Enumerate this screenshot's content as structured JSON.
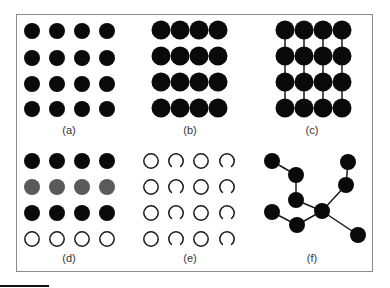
{
  "figure": {
    "colors": {
      "filled": "#0a0a0a",
      "gray": "#5a5a5a",
      "outline": "#1a1a1a",
      "edge": "#1a1a1a",
      "frame": "#8a8a8a"
    },
    "panels": [
      {
        "id": "a",
        "label": "(a)",
        "label_pos": [
          69,
          124
        ],
        "description": "4x4 grid of separated filled circles",
        "cols": [
          32,
          57,
          82,
          107
        ],
        "rows": [
          31,
          58,
          84,
          109
        ],
        "radius": 8,
        "row_styles": [
          "filled",
          "filled",
          "filled",
          "filled"
        ]
      },
      {
        "id": "b",
        "label": "(b)",
        "label_pos": [
          190,
          124
        ],
        "description": "4x4 grid of filled circles touching horizontally",
        "cols": [
          161,
          180,
          199,
          218
        ],
        "rows": [
          30,
          56,
          82,
          108
        ],
        "radius": 9.5,
        "row_styles": [
          "filled",
          "filled",
          "filled",
          "filled"
        ]
      },
      {
        "id": "c",
        "label": "(c)",
        "label_pos": [
          312,
          124
        ],
        "description": "4x4 grid of filled circles touching horizontally with vertical bonds",
        "cols": [
          285,
          304,
          323,
          342
        ],
        "rows": [
          30,
          56,
          82,
          108
        ],
        "radius": 9.5,
        "vertical_bonds": true,
        "row_styles": [
          "filled",
          "filled",
          "filled",
          "filled"
        ]
      },
      {
        "id": "d",
        "label": "(d)",
        "label_pos": [
          69,
          252
        ],
        "description": "4x4 grid with rows black, gray, black, hollow",
        "cols": [
          32,
          57,
          82,
          107
        ],
        "rows": [
          161,
          187,
          213,
          239
        ],
        "radius": 8,
        "row_styles": [
          "filled",
          "gray",
          "filled",
          "hollow"
        ]
      },
      {
        "id": "e",
        "label": "(e)",
        "label_pos": [
          190,
          252
        ],
        "description": "4x4 grid alternating hollow circles and open arcs by column",
        "cols": [
          151,
          176,
          201,
          227
        ],
        "rows": [
          161,
          187,
          213,
          239
        ],
        "radius": 8,
        "col_styles": [
          "hollow",
          "arc",
          "hollow",
          "arc"
        ]
      },
      {
        "id": "f",
        "label": "(f)",
        "label_pos": [
          312,
          252
        ],
        "description": "Branched tree network of filled nodes",
        "radius": 8,
        "nodes": [
          [
            272,
            161
          ],
          [
            296,
            175
          ],
          [
            296,
            200
          ],
          [
            272,
            212
          ],
          [
            297,
            225
          ],
          [
            322,
            211
          ],
          [
            348,
            162
          ],
          [
            346,
            185
          ],
          [
            358,
            235
          ]
        ],
        "edges": [
          [
            0,
            1
          ],
          [
            1,
            2
          ],
          [
            2,
            5
          ],
          [
            3,
            4
          ],
          [
            4,
            5
          ],
          [
            5,
            7
          ],
          [
            7,
            6
          ],
          [
            5,
            8
          ]
        ]
      }
    ]
  }
}
